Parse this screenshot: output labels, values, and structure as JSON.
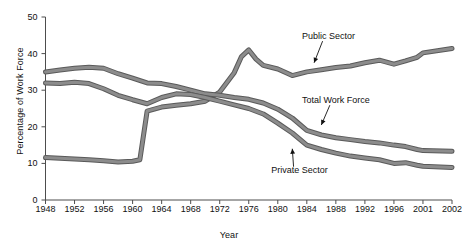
{
  "chart_data": {
    "type": "line",
    "title": "",
    "xlabel": "Year",
    "ylabel": "Percentage of Work Force",
    "xlim": [
      1948,
      2002
    ],
    "ylim": [
      0,
      50
    ],
    "grid": false,
    "legend_position": "inline-annotations",
    "x_tick_labels": [
      "1948",
      "1952",
      "1956",
      "1960",
      "1964",
      "1968",
      "1972",
      "1976",
      "1980",
      "1984",
      "1988",
      "1992",
      "1996",
      "2001",
      "2002"
    ],
    "x_tick_values": [
      1948,
      1952,
      1956,
      1960,
      1964,
      1968,
      1972,
      1976,
      1980,
      1984,
      1988,
      1992,
      1996,
      2001,
      2002
    ],
    "y_tick_labels": [
      "0",
      "10",
      "20",
      "30",
      "40",
      "50"
    ],
    "y_tick_values": [
      0,
      10,
      20,
      30,
      40,
      50
    ],
    "line_color": "#8c8c8c",
    "line_edge_color": "#5a5a5a",
    "annotations": [
      {
        "text": "Public Sector",
        "x": 1987,
        "y": 44.5,
        "arrow_to_x": 1985,
        "arrow_to_y": 37.5
      },
      {
        "text": "Total Work Force",
        "x": 1988,
        "y": 27.0,
        "arrow_to_x": 1986,
        "arrow_to_y": 20.5
      },
      {
        "text": "Private Sector",
        "x": 1983,
        "y": 8.0,
        "arrow_to_x": 1982,
        "arrow_to_y": 14.0
      }
    ],
    "series": [
      {
        "name": "Public Sector",
        "x": [
          1948,
          1950,
          1952,
          1954,
          1956,
          1958,
          1960,
          1961,
          1962,
          1964,
          1966,
          1968,
          1970,
          1972,
          1974,
          1975,
          1976,
          1977,
          1978,
          1980,
          1982,
          1984,
          1986,
          1988,
          1990,
          1992,
          1994,
          1996,
          1998,
          2000,
          2001,
          2002
        ],
        "values": [
          11.6,
          11.4,
          11.2,
          11.0,
          10.7,
          10.4,
          10.6,
          11.0,
          24.3,
          25.4,
          25.9,
          26.3,
          27.0,
          29.5,
          34.8,
          39.2,
          41.0,
          38.5,
          36.8,
          35.8,
          34.0,
          35.0,
          35.6,
          36.2,
          36.6,
          37.5,
          38.2,
          37.1,
          38.0,
          39.0,
          40.2,
          41.4
        ]
      },
      {
        "name": "Total Work Force",
        "x": [
          1948,
          1950,
          1952,
          1954,
          1956,
          1958,
          1960,
          1962,
          1964,
          1966,
          1968,
          1970,
          1972,
          1974,
          1976,
          1978,
          1980,
          1982,
          1984,
          1986,
          1988,
          1990,
          1992,
          1994,
          1996,
          1998,
          2000,
          2001,
          2002
        ],
        "values": [
          35.0,
          35.5,
          36.0,
          36.3,
          36.0,
          34.5,
          33.3,
          32.0,
          31.8,
          31.0,
          30.0,
          29.0,
          28.6,
          28.0,
          27.5,
          26.5,
          24.8,
          22.4,
          19.0,
          17.8,
          17.0,
          16.5,
          16.0,
          15.6,
          15.0,
          14.6,
          13.8,
          13.5,
          13.3
        ]
      },
      {
        "name": "Private Sector",
        "x": [
          1948,
          1950,
          1952,
          1954,
          1956,
          1958,
          1960,
          1962,
          1964,
          1966,
          1968,
          1970,
          1972,
          1974,
          1976,
          1978,
          1980,
          1982,
          1984,
          1986,
          1988,
          1990,
          1992,
          1994,
          1996,
          1998,
          2000,
          2001,
          2002
        ],
        "values": [
          32.0,
          31.8,
          32.2,
          31.8,
          30.4,
          28.6,
          27.4,
          26.3,
          28.0,
          29.0,
          28.8,
          28.0,
          27.0,
          26.0,
          25.0,
          23.5,
          21.0,
          18.3,
          15.0,
          13.8,
          12.8,
          12.0,
          11.5,
          11.0,
          10.0,
          10.2,
          9.5,
          9.2,
          8.9
        ]
      }
    ]
  }
}
